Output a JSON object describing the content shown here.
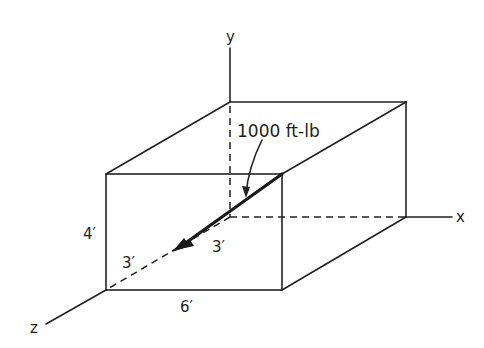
{
  "diagram": {
    "type": "isometric box with coordinate axes",
    "axes": {
      "x_label": "x",
      "y_label": "y",
      "z_label": "z"
    },
    "dimensions": {
      "height": "4′",
      "width": "6′",
      "depth_front": "3′",
      "depth_back": "3′"
    },
    "moment": {
      "label": "1000 ft-lb"
    }
  },
  "colors": {
    "line": "#222222",
    "background": "#ffffff"
  }
}
